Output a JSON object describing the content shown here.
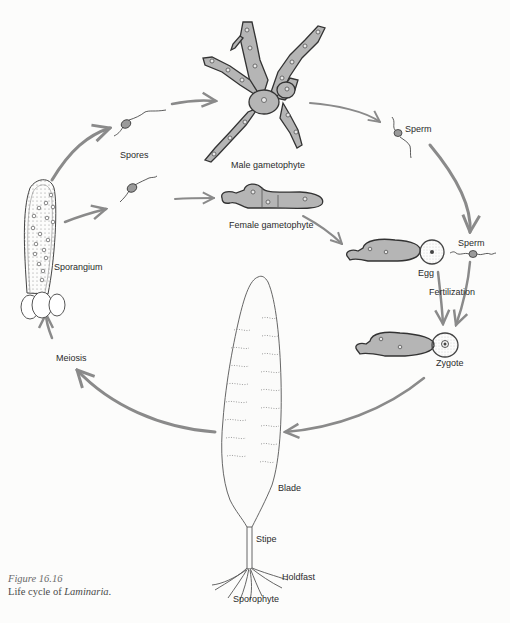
{
  "figure": {
    "number": "Figure 16.16",
    "caption_prefix": "Life cycle of ",
    "caption_taxon": "Laminaria",
    "caption_suffix": "."
  },
  "labels": {
    "spores": "Spores",
    "male_gametophyte": "Male gametophyte",
    "female_gametophyte": "Female gametophyte",
    "sperm_top": "Sperm",
    "sperm_right": "Sperm",
    "egg": "Egg",
    "fertilization": "Fertilization",
    "zygote": "Zygote",
    "sporangium": "Sporangium",
    "meiosis": "Meiosis",
    "blade": "Blade",
    "stipe": "Stipe",
    "holdfast": "Holdfast",
    "sporophyte": "Sporophyte"
  },
  "colors": {
    "arrow": "#8a8a8a",
    "outline": "#3a3a3a",
    "cell_fill": "#b9b9b9",
    "background": "#fcfcfb",
    "text": "#2b2b2b"
  },
  "cycle": [
    "Sporophyte",
    "Meiosis",
    "Sporangium",
    "Spores",
    "Male gametophyte",
    "Female gametophyte",
    "Sperm",
    "Egg",
    "Fertilization",
    "Zygote",
    "Sporophyte"
  ]
}
